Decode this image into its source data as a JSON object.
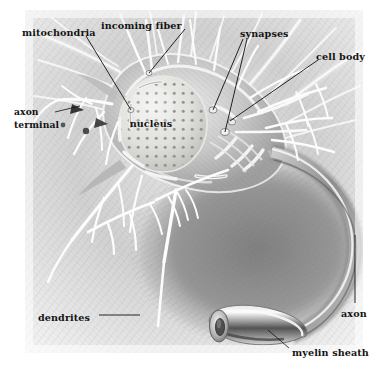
{
  "figure": {
    "style": "graphite pencil rendering, grayscale",
    "canvas": {
      "width": 382,
      "height": 377,
      "background": "#ffffff"
    },
    "plate": {
      "x": 25,
      "y": 10,
      "width": 338,
      "height": 343
    },
    "palette": {
      "background": "#ffffff",
      "paper_light": "#f2f2f2",
      "graphite_light": "#cfcfcf",
      "graphite_mid": "#9a9a9a",
      "graphite_dark": "#6b6b6b",
      "graphite_deep": "#4a4a4a",
      "highlight_white": "#fdfdfd",
      "label_text": "#141414",
      "leader_line": "#101010"
    },
    "labels": [
      {
        "id": "mitochondria",
        "text": "mitochondria",
        "anchor": "left",
        "text_x": 22,
        "text_y": 33,
        "leader": "M 86,36 L 131,110"
      },
      {
        "id": "incoming-fiber",
        "text": "incoming fiber",
        "anchor": "center",
        "text_x": 101,
        "text_y": 26,
        "leader": "M 185,29 L 149,73"
      },
      {
        "id": "synapses",
        "text": "synapses",
        "anchor": "left",
        "text_x": 240,
        "text_y": 34,
        "leaders": [
          "M 243,39 L 213,110",
          "M 247,39 L 225,132"
        ]
      },
      {
        "id": "cell-body",
        "text": "cell body",
        "anchor": "left",
        "text_x": 316,
        "text_y": 57,
        "leader": "M 318,60 L 230,121"
      },
      {
        "id": "axon-terminal",
        "text": "axon\nterminal",
        "line1": "axon",
        "line2": "terminal",
        "anchor": "left",
        "text_x": 14,
        "text_y": 115,
        "leader": "M 55,112 L 80,106"
      },
      {
        "id": "nucleus",
        "text": "nucleus",
        "anchor": "center",
        "text_x": 151,
        "text_y": 124,
        "leader": null
      },
      {
        "id": "dendrites",
        "text": "dendrites",
        "anchor": "left",
        "text_x": 38,
        "text_y": 318,
        "leader": "M 99,315 L 140,315"
      },
      {
        "id": "axon",
        "text": "axon",
        "anchor": "left",
        "text_x": 341,
        "text_y": 314,
        "leader": "M 355,235 L 355,303"
      },
      {
        "id": "myelin-sheath",
        "text": "myelin sheath",
        "anchor": "left",
        "text_x": 292,
        "text_y": 353,
        "leader": "M 289,348 L 268,330"
      }
    ],
    "structures": [
      {
        "name": "cell-body-soma",
        "description": "central irregular cell body with cutaway showing interior"
      },
      {
        "name": "nucleus",
        "description": "large ovoid nucleus stippled with dark nuclear pores"
      },
      {
        "name": "mitochondria",
        "description": "elongated rod organelles inside the soma"
      },
      {
        "name": "dendrites",
        "description": "bright branching processes radiating from the soma"
      },
      {
        "name": "incoming-fibers",
        "description": "fibers arriving from upper left and upper right"
      },
      {
        "name": "synapses",
        "description": "contact knobs where incoming fibers meet the soma"
      },
      {
        "name": "axon",
        "description": "long sweeping process curving to lower right"
      },
      {
        "name": "myelin-sheath",
        "description": "cut tubular sheath at the severed axon end"
      },
      {
        "name": "axon-terminal",
        "description": "terminal boutons at the left"
      }
    ]
  }
}
